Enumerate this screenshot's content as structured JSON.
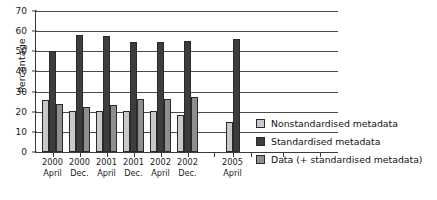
{
  "chart_data": {
    "type": "bar",
    "title": "",
    "xlabel": "",
    "ylabel": "Percentage",
    "ylim": [
      0,
      70
    ],
    "yticks": [
      0,
      10,
      20,
      30,
      40,
      50,
      60,
      70
    ],
    "grid": true,
    "legend_position": "right",
    "categories": [
      "2000 April",
      "2000 Dec.",
      "2001 April",
      "2001 Dec.",
      "2002 April",
      "2002 Dec.",
      "2005 April"
    ],
    "category_lines": [
      {
        "year": "2000",
        "month": "April"
      },
      {
        "year": "2000",
        "month": "Dec."
      },
      {
        "year": "2001",
        "month": "April"
      },
      {
        "year": "2001",
        "month": "Dec."
      },
      {
        "year": "2002",
        "month": "April"
      },
      {
        "year": "2002",
        "month": "Dec."
      },
      {
        "year": "2005",
        "month": "April"
      }
    ],
    "series": [
      {
        "name": "Nonstandardised metadata",
        "color": "#c9c9c9",
        "values": [
          26,
          20.5,
          20.5,
          20.5,
          20.5,
          18.5,
          15
        ]
      },
      {
        "name": "Standardised metadata",
        "color": "#3d3d3d",
        "values": [
          50,
          58,
          57.5,
          54.5,
          54.5,
          55,
          56
        ]
      },
      {
        "name": "Data (+ standardised metadata)",
        "color": "#8e8e8e",
        "values": [
          24,
          22.5,
          23.5,
          26.5,
          26.5,
          27.5,
          null
        ]
      }
    ]
  },
  "legend": {
    "items": [
      {
        "label": "Nonstandardised metadata",
        "color": "#c9c9c9"
      },
      {
        "label": "Standardised metadata",
        "color": "#3d3d3d"
      },
      {
        "label": "Data (+ standardised metadata)",
        "color": "#8e8e8e"
      }
    ]
  },
  "axes": {
    "y_title": "Percentage",
    "y_ticks": [
      "0",
      "10",
      "20",
      "30",
      "40",
      "50",
      "60",
      "70"
    ]
  }
}
